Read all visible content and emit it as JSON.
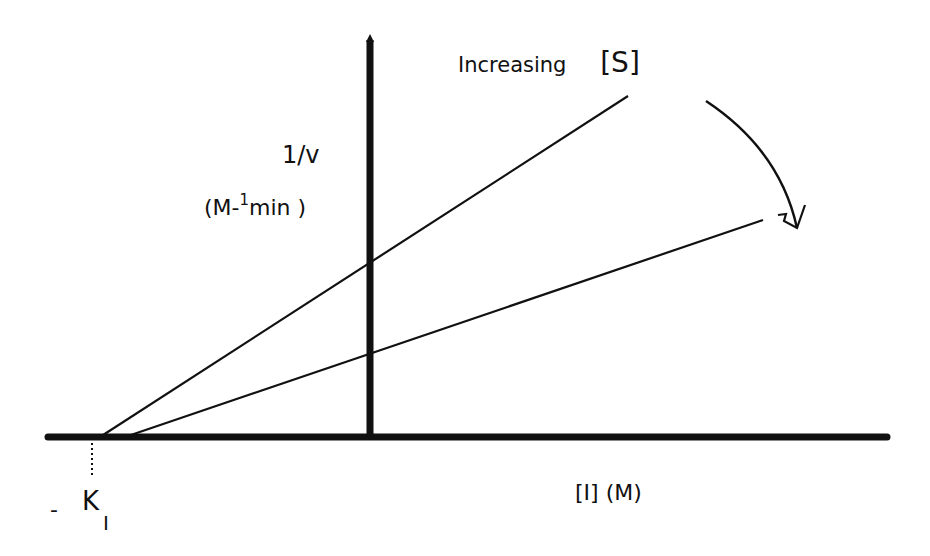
{
  "diagram": {
    "type": "Dixon plot (1/v vs [I])",
    "colors": {
      "ink": "#111111",
      "background": "#ffffff"
    },
    "y_axis": {
      "label": "1/v",
      "units": "(M-1min)",
      "units_base": "(M-",
      "units_sup": "1",
      "units_rest": "min )"
    },
    "x_axis": {
      "label": "[I] (M)"
    },
    "intercept_label": {
      "prefix": "-",
      "main": "K",
      "subscript": "I"
    },
    "annotation": {
      "text": "Increasing",
      "bracket_label": "[S]"
    },
    "lines": [
      {
        "name": "low-substrate-line",
        "x1": 100,
        "y1": 437,
        "x2": 628,
        "y2": 96
      },
      {
        "name": "high-substrate-line",
        "x1": 125,
        "y1": 437,
        "x2": 763,
        "y2": 220
      }
    ]
  }
}
